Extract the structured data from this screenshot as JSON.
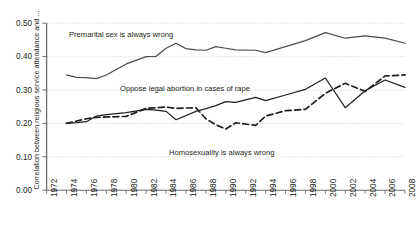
{
  "chart_data": {
    "type": "line",
    "title": "",
    "xlabel": "",
    "ylabel": "Correlation between religious service attendance and ...",
    "xlim": [
      1972,
      2008
    ],
    "ylim": [
      0.0,
      0.5
    ],
    "grid": true,
    "legend_position": "inline-annotations",
    "xticks": [
      "1972",
      "1974",
      "1976",
      "1978",
      "1980",
      "1982",
      "1984",
      "1986",
      "1988",
      "1990",
      "1992",
      "1994",
      "1996",
      "1998",
      "2000",
      "2002",
      "2004",
      "2006",
      "2008"
    ],
    "yticks": [
      "0.00",
      "0.10",
      "0.20",
      "0.30",
      "0.40",
      "0.50"
    ],
    "series": [
      {
        "name": "Premarital sex is always wrong",
        "style": "solid",
        "color": "#4d4d4d",
        "annotation": "Premarital sex is always wrong",
        "x": [
          1974,
          1975,
          1976,
          1977,
          1978,
          1980,
          1982,
          1983,
          1984,
          1985,
          1986,
          1987,
          1988,
          1989,
          1990,
          1991,
          1993,
          1994,
          1996,
          1998,
          2000,
          2002,
          2004,
          2006,
          2008
        ],
        "y": [
          0.345,
          0.338,
          0.337,
          0.334,
          0.345,
          0.378,
          0.4,
          0.401,
          0.425,
          0.44,
          0.424,
          0.42,
          0.419,
          0.43,
          0.425,
          0.42,
          0.419,
          0.412,
          0.43,
          0.448,
          0.472,
          0.455,
          0.462,
          0.455,
          0.44
        ]
      },
      {
        "name": "Oppose legal abortion in cases of rape",
        "style": "solid",
        "color": "#231f20",
        "annotation": "Oppose legal abortion in cases of rape",
        "x": [
          1974,
          1975,
          1976,
          1977,
          1978,
          1980,
          1982,
          1983,
          1984,
          1985,
          1987,
          1988,
          1989,
          1990,
          1991,
          1993,
          1994,
          1996,
          1998,
          2000,
          2002,
          2004,
          2006,
          2008
        ],
        "y": [
          0.2,
          0.202,
          0.205,
          0.222,
          0.226,
          0.232,
          0.242,
          0.24,
          0.236,
          0.211,
          0.236,
          0.244,
          0.253,
          0.265,
          0.263,
          0.278,
          0.268,
          0.285,
          0.302,
          0.336,
          0.247,
          0.298,
          0.33,
          0.308
        ]
      },
      {
        "name": "Homosexuality is always wrong",
        "style": "dashed",
        "color": "#231f20",
        "annotation": "Homosexuality is always wrong",
        "x": [
          1974,
          1976,
          1977,
          1980,
          1982,
          1984,
          1985,
          1987,
          1988,
          1989,
          1990,
          1991,
          1993,
          1994,
          1996,
          1998,
          2000,
          2002,
          2004,
          2006,
          2008
        ],
        "y": [
          0.2,
          0.214,
          0.218,
          0.221,
          0.245,
          0.249,
          0.245,
          0.247,
          0.214,
          0.196,
          0.183,
          0.202,
          0.194,
          0.222,
          0.238,
          0.242,
          0.29,
          0.32,
          0.296,
          0.342,
          0.345
        ]
      }
    ]
  },
  "annotations": {
    "premarital": "Premarital sex is always wrong",
    "abortion": "Oppose legal abortion in cases of rape",
    "homosexuality": "Homosexuality is always wrong"
  }
}
